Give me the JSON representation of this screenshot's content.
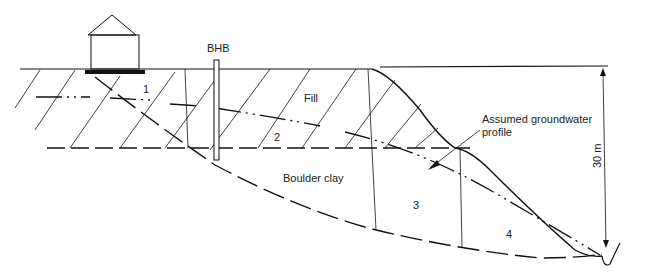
{
  "diagram": {
    "type": "geotechnical cross-section",
    "labels": {
      "borehole": "BHB",
      "fill": "Fill",
      "boulder_clay": "Boulder clay",
      "groundwater": [
        "Assumed groundwater",
        "profile"
      ],
      "height_dim": "30 m"
    },
    "slices": [
      "1",
      "2",
      "3",
      "4"
    ],
    "colors": {
      "ink": "#111111",
      "background": "#ffffff"
    }
  }
}
